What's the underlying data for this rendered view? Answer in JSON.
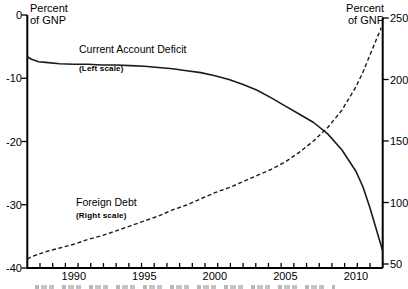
{
  "chart_data": {
    "type": "line",
    "title": "",
    "grid": false,
    "legend_position": "inline-annotations",
    "x_axis": {
      "range_years": [
        1986.7,
        2011.9
      ],
      "tick_label_years": [
        1990,
        1995,
        2000,
        2005,
        2010
      ],
      "minor_tick_count": 27
    },
    "left_axis": {
      "unit_lines": [
        "Percent",
        "of GNP"
      ],
      "ticks": [
        0,
        -10,
        -20,
        -30,
        -40
      ],
      "range": [
        -40,
        0
      ]
    },
    "right_axis": {
      "unit_lines": [
        "Percent",
        "of GNP"
      ],
      "ticks": [
        250,
        200,
        150,
        100,
        50
      ],
      "range": [
        50,
        250
      ]
    },
    "series": [
      {
        "name": "Current Account Deficit",
        "scale_note": "(Left scale)",
        "scale": "left",
        "style": "solid",
        "points": [
          [
            1986.7,
            -6.6
          ],
          [
            1987,
            -7.0
          ],
          [
            1987.5,
            -7.4
          ],
          [
            1988,
            -7.5
          ],
          [
            1989,
            -7.7
          ],
          [
            1990,
            -7.8
          ],
          [
            1991,
            -7.8
          ],
          [
            1992,
            -7.9
          ],
          [
            1993,
            -7.9
          ],
          [
            1994,
            -8.0
          ],
          [
            1995,
            -8.1
          ],
          [
            1996,
            -8.3
          ],
          [
            1997,
            -8.5
          ],
          [
            1998,
            -8.8
          ],
          [
            1999,
            -9.1
          ],
          [
            2000,
            -9.6
          ],
          [
            2001,
            -10.2
          ],
          [
            2002,
            -11.0
          ],
          [
            2003,
            -11.9
          ],
          [
            2004,
            -13.1
          ],
          [
            2005,
            -14.4
          ],
          [
            2006,
            -15.7
          ],
          [
            2007,
            -17.0
          ],
          [
            2008,
            -18.8
          ],
          [
            2009,
            -21.3
          ],
          [
            2010,
            -24.7
          ],
          [
            2010.5,
            -27.2
          ],
          [
            2011,
            -30.5
          ],
          [
            2011.5,
            -34.3
          ],
          [
            2011.9,
            -37.3
          ]
        ]
      },
      {
        "name": "Foreign Debt",
        "scale_note": "(Right scale)",
        "scale": "right",
        "style": "dashed",
        "points": [
          [
            1986.7,
            54
          ],
          [
            1987,
            56
          ],
          [
            1988,
            60
          ],
          [
            1989,
            63
          ],
          [
            1990,
            66
          ],
          [
            1991,
            70
          ],
          [
            1992,
            73
          ],
          [
            1993,
            77
          ],
          [
            1994,
            81
          ],
          [
            1995,
            85
          ],
          [
            1996,
            89
          ],
          [
            1997,
            94
          ],
          [
            1998,
            98
          ],
          [
            1999,
            103
          ],
          [
            2000,
            108
          ],
          [
            2001,
            112
          ],
          [
            2002,
            117
          ],
          [
            2003,
            122
          ],
          [
            2004,
            127
          ],
          [
            2005,
            133
          ],
          [
            2006,
            141
          ],
          [
            2007,
            150
          ],
          [
            2008,
            161
          ],
          [
            2009,
            175
          ],
          [
            2010,
            194
          ],
          [
            2010.5,
            206
          ],
          [
            2011,
            220
          ],
          [
            2011.5,
            234
          ],
          [
            2011.8,
            242
          ]
        ]
      }
    ]
  }
}
